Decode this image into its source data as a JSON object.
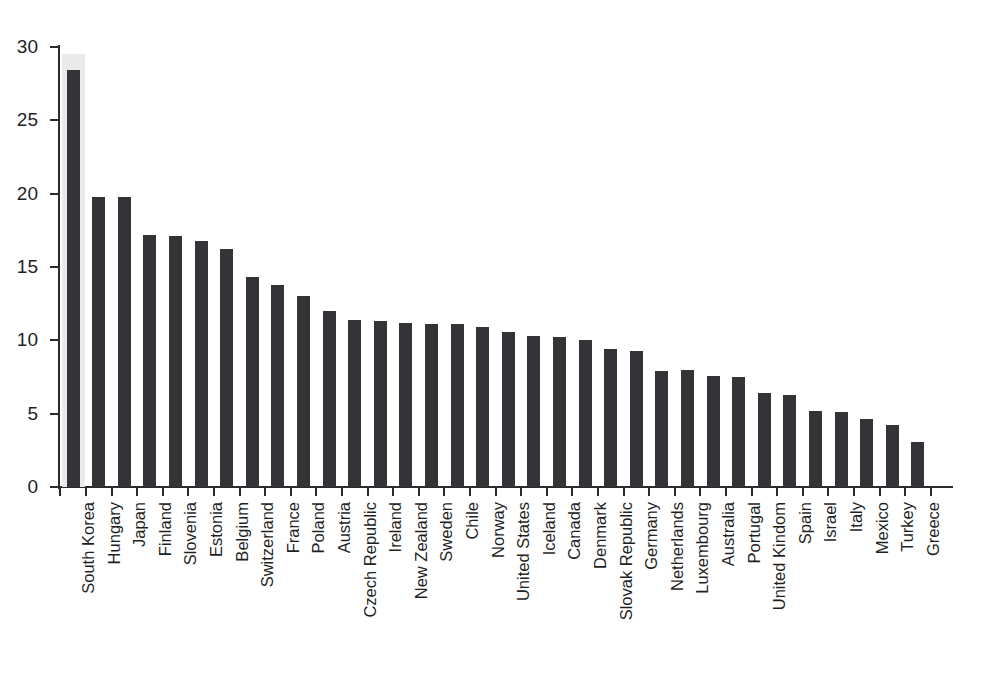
{
  "chart_data": {
    "type": "bar",
    "title": "",
    "subtitle": "",
    "xlabel": "",
    "ylabel": "",
    "ylim": [
      0,
      30
    ],
    "yticks": [
      0,
      5,
      10,
      15,
      20,
      25,
      30
    ],
    "ytick_labels": [
      "0",
      "5",
      "10",
      "15",
      "20",
      "25",
      "30"
    ],
    "grid": false,
    "legend": null,
    "bar_color": "#333338",
    "highlight_color": "#eaeaea",
    "highlighted_category": "South Korea",
    "categories": [
      "South Korea",
      "Hungary",
      "Japan",
      "Finland",
      "Slovenia",
      "Estonia",
      "Belgium",
      "Switzerland",
      "France",
      "Poland",
      "Austria",
      "Czech Republic",
      "Ireland",
      "New Zealand",
      "Sweden",
      "Chile",
      "Norway",
      "United States",
      "Iceland",
      "Canada",
      "Denmark",
      "Slovak Republic",
      "Germany",
      "Netherlands",
      "Luxembourg",
      "Australia",
      "Portugal",
      "United Kindom",
      "Spain",
      "Israel",
      "Italy",
      "Mexico",
      "Turkey",
      "Greece"
    ],
    "values": [
      28.4,
      19.8,
      19.8,
      17.2,
      17.1,
      16.8,
      16.2,
      14.3,
      13.8,
      13.0,
      12.0,
      11.4,
      11.3,
      11.2,
      11.1,
      11.1,
      10.9,
      10.6,
      10.3,
      10.25,
      10.0,
      9.4,
      9.25,
      7.9,
      8.0,
      7.6,
      7.5,
      6.4,
      6.25,
      5.2,
      5.1,
      4.65,
      4.25,
      3.1
    ]
  }
}
